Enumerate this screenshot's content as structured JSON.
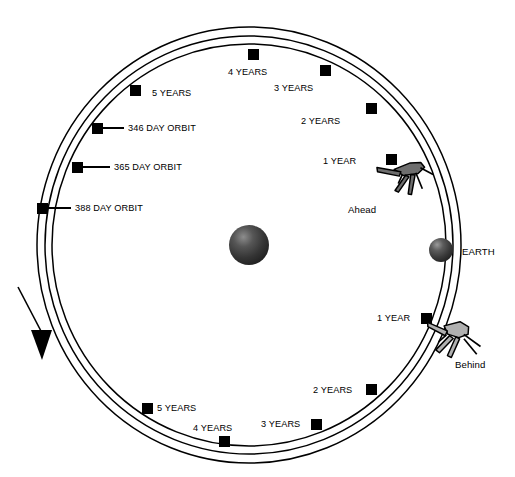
{
  "diagram": {
    "background_color": "#ffffff",
    "line_color": "#000000",
    "sun": {
      "name": "sun-sphere",
      "color_dark": "#2e2e2e",
      "color_highlight": "#8d8d8d",
      "cx": 249,
      "cy": 245,
      "r": 20
    },
    "earth": {
      "label": "EARTH",
      "color_dark": "#333333",
      "color_highlight": "#8f8f8f",
      "cx": 441,
      "cy": 250,
      "r": 12
    },
    "orbits": [
      {
        "name": "346-day-orbit",
        "label": "346 DAY ORBIT",
        "rx": 197,
        "ry": 201
      },
      {
        "name": "365-day-orbit",
        "label": "365 DAY ORBIT",
        "rx": 204,
        "ry": 209
      },
      {
        "name": "388-day-orbit",
        "label": "388 DAY ORBIT",
        "rx": 212,
        "ry": 218
      }
    ],
    "spacecraft": [
      {
        "name": "ahead-spacecraft",
        "label": "Ahead",
        "fill": "#6e6e6e"
      },
      {
        "name": "behind-spacecraft",
        "label": "Behind",
        "fill": "#b0b0b0"
      }
    ],
    "direction_arrow": {
      "name": "orbit-direction-arrow",
      "description": "counterclockwise drift direction"
    },
    "markers": {
      "ahead_inner": [
        {
          "label": "1 YEAR",
          "x": 392,
          "y": 160,
          "tx": 362,
          "ty": 162,
          "anchor": "end"
        },
        {
          "label": "2 YEARS",
          "x": 371,
          "y": 108,
          "tx": 345,
          "ty": 122,
          "anchor": "end"
        },
        {
          "label": "3 YEARS",
          "x": 325,
          "y": 70,
          "tx": 318,
          "ty": 89,
          "anchor": "end"
        },
        {
          "label": "4 YEARS",
          "x": 253,
          "y": 54,
          "tx": 254,
          "ty": 74,
          "anchor": "middle"
        },
        {
          "label": "5 YEARS",
          "x": 135,
          "y": 90,
          "tx": 152,
          "ty": 94,
          "anchor": "start"
        }
      ],
      "behind_outer": [
        {
          "label": "1 YEAR",
          "x": 426,
          "y": 318,
          "tx": 408,
          "ty": 321,
          "anchor": "end"
        },
        {
          "label": "2 YEARS",
          "x": 371,
          "y": 389,
          "tx": 348,
          "ty": 392,
          "anchor": "end"
        },
        {
          "label": "3 YEARS",
          "x": 316,
          "y": 424,
          "tx": 296,
          "ty": 427,
          "anchor": "end"
        },
        {
          "label": "4 YEARS",
          "x": 224,
          "y": 441,
          "tx": 221,
          "ty": 432,
          "anchor": "middle"
        },
        {
          "label": "5 YEARS",
          "x": 147,
          "y": 408,
          "tx": 157,
          "ty": 411,
          "anchor": "start"
        }
      ],
      "orbit_callouts": [
        {
          "label": "346 DAY ORBIT",
          "x": 97,
          "y": 128,
          "lx1": 103,
          "lx2": 124,
          "tx": 128,
          "ty": 131
        },
        {
          "label": "365 DAY ORBIT",
          "x": 77,
          "y": 167,
          "lx1": 83,
          "lx2": 110,
          "tx": 114,
          "ty": 170
        },
        {
          "label": "388 DAY ORBIT",
          "x": 42,
          "y": 208,
          "lx1": 48,
          "lx2": 71,
          "tx": 75,
          "ty": 211
        }
      ]
    },
    "body_labels": [
      {
        "name": "earth-label",
        "label": "EARTH",
        "x": 462,
        "y": 254
      }
    ],
    "craft_labels": [
      {
        "name": "ahead-label",
        "label": "Ahead",
        "x": 348,
        "y": 211
      },
      {
        "name": "behind-label",
        "label": "Behind",
        "x": 455,
        "y": 366
      }
    ]
  }
}
